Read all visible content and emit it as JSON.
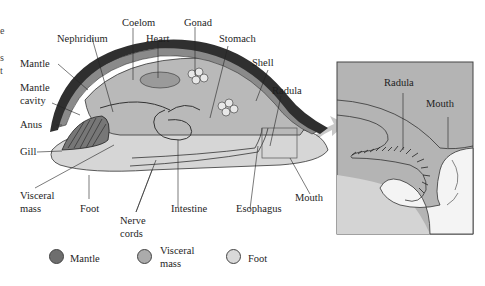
{
  "diagram": {
    "labels": {
      "coelom": "Coelom",
      "gonad": "Gonad",
      "nephridium": "Nephridium",
      "heart": "Heart",
      "stomach": "Stomach",
      "shell": "Shell",
      "radula": "Radula",
      "mantle": "Mantle",
      "mantle_cavity_1": "Mantle",
      "mantle_cavity_2": "cavity",
      "anus": "Anus",
      "gill": "Gill",
      "visceral_mass_1": "Visceral",
      "visceral_mass_2": "mass",
      "foot": "Foot",
      "nerve_cords_1": "Nerve",
      "nerve_cords_2": "cords",
      "intestine": "Intestine",
      "esophagus": "Esophagus",
      "mouth": "Mouth"
    },
    "inset": {
      "radula": "Radula",
      "mouth": "Mouth"
    },
    "left_fragment": [
      "e",
      "s",
      "t"
    ],
    "legend": [
      {
        "label_1": "Mantle",
        "label_2": "",
        "color": "#6e6e6e"
      },
      {
        "label_1": "Visceral",
        "label_2": "mass",
        "color": "#ababab"
      },
      {
        "label_1": "Foot",
        "label_2": "",
        "color": "#d9d9d9"
      }
    ],
    "colors": {
      "shell": "#2f2f2f",
      "mantle": "#8a8a8a",
      "visceral_mass": "#b9b9b9",
      "foot": "#d6d6d6",
      "inset_bg": "#b4b4b4",
      "arrow": "#c8c8c8"
    }
  }
}
